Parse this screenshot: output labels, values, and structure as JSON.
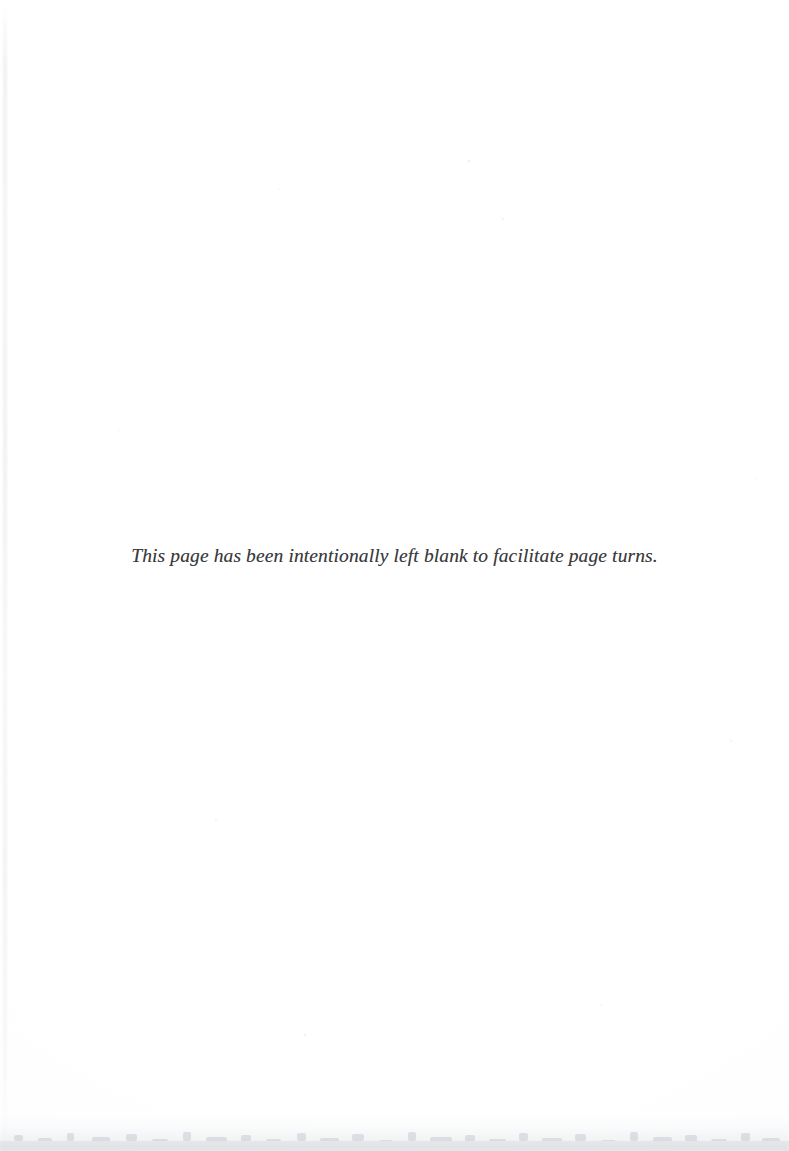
{
  "document": {
    "kind": "scanned-book-page",
    "page_type": "intentionally-blank",
    "background_color": "#ffffff",
    "text_color": "#3a3a3c"
  },
  "notice": {
    "text": "This page has been intentionally left blank to facilitate page turns.",
    "style": "italic-serif",
    "alignment": "center"
  },
  "artifacts": {
    "left_streak": "faint vertical scanner streak along the left edge",
    "bottom_edge": "mottled grey page-edge shadow along the bottom",
    "specks": "scattered faint scanner specks"
  }
}
